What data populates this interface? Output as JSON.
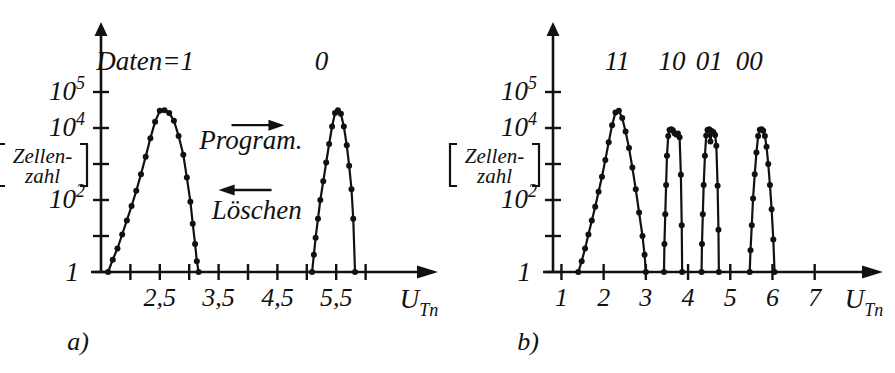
{
  "figure": {
    "caption_a": "a)",
    "caption_b": "b)",
    "y_axis_label_line1": "Zellen-",
    "y_axis_label_line2": "zahl",
    "x_axis_label_base": "U",
    "x_axis_label_sub": "Tn"
  },
  "chart_data": [
    {
      "type": "line",
      "id": "panel-a",
      "title": "a)",
      "xlabel": "U_Tn",
      "ylabel": "[Zellen-zahl]",
      "xlim": [
        1.5,
        6.5
      ],
      "ylim": [
        1,
        1000000
      ],
      "yscale": "log",
      "grid": false,
      "legend": "none",
      "xticks": [
        2.0,
        2.5,
        3.0,
        3.5,
        4.0,
        4.5,
        5.0,
        5.5,
        6.0
      ],
      "xticklabels": [
        "",
        "2,5",
        "",
        "3,5",
        "",
        "4,5",
        "",
        "5,5",
        ""
      ],
      "yticks": [
        1,
        100,
        10000,
        100000,
        1000000
      ],
      "yticklabels": [
        "1",
        "10²",
        "",
        "10⁴",
        "10⁵"
      ],
      "annotations": [
        {
          "text": "Daten=1",
          "x": 2.25,
          "y": 400000,
          "name": "daten-eq-1-label"
        },
        {
          "text": "0",
          "x": 5.25,
          "y": 400000,
          "name": "zero-label"
        },
        {
          "text": "Program.",
          "x": 4.05,
          "y": 2600,
          "name": "program-label"
        },
        {
          "text": "Löschen",
          "x": 4.15,
          "y": 30,
          "name": "loeschen-label"
        }
      ],
      "arrows": [
        {
          "name": "program-arrow",
          "direction": "right",
          "x_from": 3.72,
          "x_to": 4.62,
          "y": 12000
        },
        {
          "name": "loeschen-arrow",
          "direction": "left",
          "x_from": 4.4,
          "x_to": 3.5,
          "y": 190
        }
      ],
      "series": [
        {
          "name": "Daten=1 distribution",
          "marker": "filled-circle",
          "x": [
            1.62,
            1.7,
            1.78,
            1.86,
            1.94,
            2.02,
            2.1,
            2.18,
            2.26,
            2.34,
            2.42,
            2.5,
            2.58,
            2.66,
            2.74,
            2.82,
            2.9,
            2.96,
            3.02,
            3.06,
            3.1,
            3.13,
            3.16
          ],
          "y": [
            1,
            2.2,
            4.5,
            11,
            27,
            68,
            180,
            520,
            1600,
            5200,
            15000,
            30000,
            31000,
            26000,
            16000,
            6000,
            1800,
            420,
            90,
            22,
            6,
            2,
            1
          ]
        },
        {
          "name": "Daten=0 distribution",
          "marker": "filled-circle",
          "x": [
            5.09,
            5.12,
            5.15,
            5.19,
            5.23,
            5.28,
            5.33,
            5.38,
            5.43,
            5.48,
            5.53,
            5.58,
            5.63,
            5.68,
            5.72,
            5.76,
            5.79,
            5.82
          ],
          "y": [
            1,
            3,
            9,
            30,
            100,
            330,
            1100,
            3600,
            11000,
            26000,
            31000,
            25000,
            11000,
            3300,
            900,
            200,
            30,
            1
          ]
        }
      ]
    },
    {
      "type": "line",
      "id": "panel-b",
      "title": "b)",
      "xlabel": "U_Tn",
      "ylabel": "[Zellen-zahl]",
      "xlim": [
        0.8,
        7.6
      ],
      "ylim": [
        1,
        1000000
      ],
      "yscale": "log",
      "grid": false,
      "legend": "none",
      "xticks": [
        1,
        2,
        3,
        4,
        5,
        6,
        7
      ],
      "xticklabels": [
        "1",
        "2",
        "3",
        "4",
        "5",
        "6",
        "7"
      ],
      "yticks": [
        1,
        100,
        10000,
        100000,
        1000000
      ],
      "yticklabels": [
        "1",
        "10²",
        "",
        "10⁴",
        "10⁵"
      ],
      "annotations": [
        {
          "text": "11",
          "x": 2.32,
          "y": 400000,
          "name": "state-11-label"
        },
        {
          "text": "10",
          "x": 3.62,
          "y": 400000,
          "name": "state-10-label"
        },
        {
          "text": "01",
          "x": 4.5,
          "y": 400000,
          "name": "state-01-label"
        },
        {
          "text": "00",
          "x": 5.45,
          "y": 400000,
          "name": "state-00-label"
        }
      ],
      "arrows": [],
      "series": [
        {
          "name": "state 11 distribution",
          "marker": "filled-circle",
          "x": [
            1.4,
            1.48,
            1.56,
            1.64,
            1.72,
            1.8,
            1.88,
            1.96,
            2.04,
            2.12,
            2.2,
            2.28,
            2.36,
            2.44,
            2.52,
            2.6,
            2.68,
            2.76,
            2.84,
            2.92,
            2.97,
            3.0
          ],
          "y": [
            1,
            2,
            4.5,
            11,
            27,
            65,
            170,
            440,
            1300,
            4000,
            12000,
            27000,
            30000,
            19000,
            8000,
            2800,
            800,
            200,
            45,
            10,
            3,
            1
          ]
        },
        {
          "name": "state 10 distribution",
          "marker": "filled-circle",
          "x": [
            3.43,
            3.44,
            3.46,
            3.48,
            3.5,
            3.53,
            3.56,
            3.6,
            3.64,
            3.68,
            3.72,
            3.76,
            3.8,
            3.83,
            3.85,
            3.86
          ],
          "y": [
            1,
            6,
            40,
            260,
            1700,
            6000,
            8800,
            9300,
            8600,
            7200,
            6600,
            7000,
            5500,
            500,
            20,
            1
          ]
        },
        {
          "name": "state 01 distribution",
          "marker": "filled-circle",
          "x": [
            4.32,
            4.33,
            4.35,
            4.37,
            4.4,
            4.43,
            4.46,
            4.5,
            4.53,
            4.56,
            4.6,
            4.64,
            4.67,
            4.7,
            4.72,
            4.73
          ],
          "y": [
            1,
            6,
            40,
            260,
            1700,
            6200,
            8800,
            9200,
            4200,
            8200,
            7600,
            6400,
            3200,
            250,
            15,
            1
          ]
        },
        {
          "name": "state 00 distribution",
          "marker": "filled-circle",
          "x": [
            5.46,
            5.48,
            5.51,
            5.54,
            5.58,
            5.62,
            5.66,
            5.7,
            5.74,
            5.78,
            5.82,
            5.86,
            5.9,
            5.94,
            5.98,
            6.02,
            6.05
          ],
          "y": [
            1,
            4,
            20,
            110,
            520,
            2100,
            6000,
            9000,
            9300,
            8400,
            6000,
            3000,
            1000,
            260,
            55,
            8,
            1
          ]
        }
      ]
    }
  ]
}
